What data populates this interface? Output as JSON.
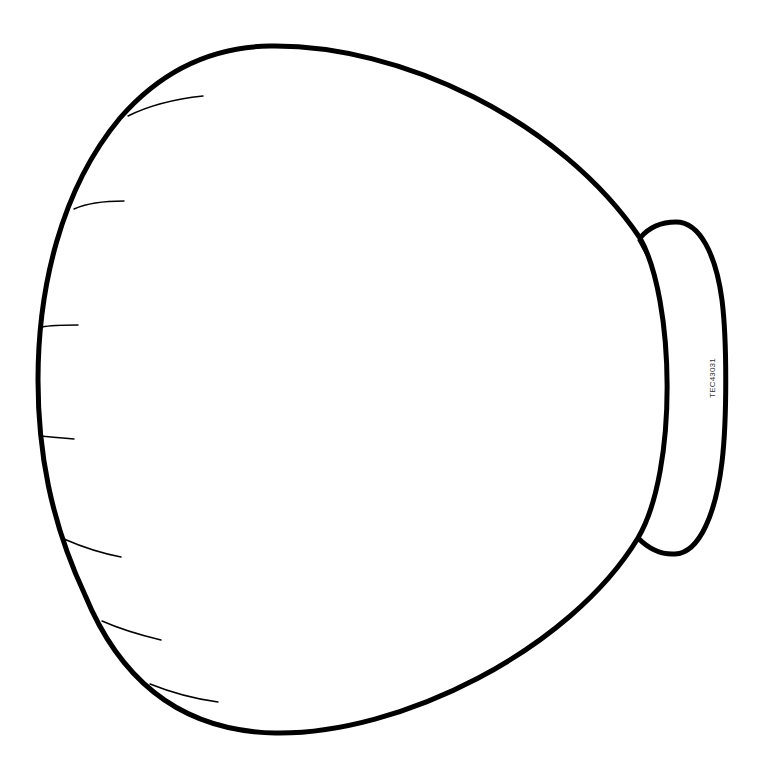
{
  "diagram": {
    "type": "line-art-outline",
    "stroke_color": "#000000",
    "background": "#ffffff",
    "reference_code": "TEC43031",
    "hairline_count_left": 7,
    "tab_side": "right"
  }
}
